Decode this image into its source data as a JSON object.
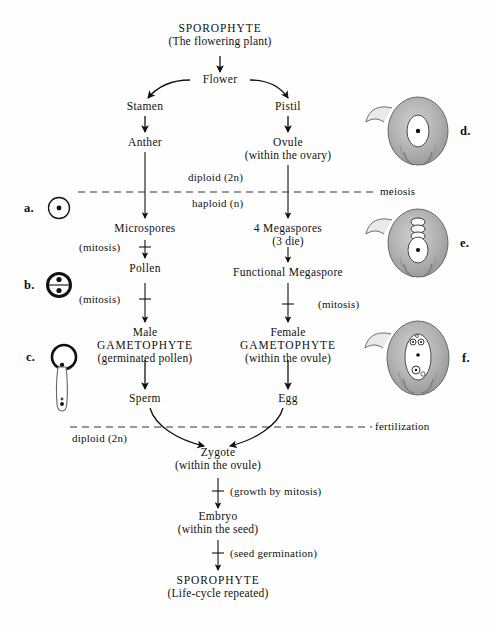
{
  "diagram": {
    "nodes": {
      "sporophyte_top": {
        "line1": "SPOROPHYTE",
        "line2": "(The flowering plant)"
      },
      "flower": {
        "line1": "Flower",
        "line2": ""
      },
      "stamen": {
        "line1": "Stamen",
        "line2": ""
      },
      "pistil": {
        "line1": "Pistil",
        "line2": ""
      },
      "anther": {
        "line1": "Anther",
        "line2": ""
      },
      "ovule": {
        "line1": "Ovule",
        "line2": "(within the ovary)"
      },
      "microspores": {
        "line1": "Microspores",
        "line2": ""
      },
      "megaspores": {
        "line1": "4 Megaspores",
        "line2": "(3 die)"
      },
      "pollen": {
        "line1": "Pollen",
        "line2": ""
      },
      "functional_megaspore": {
        "line1": "Functional Megaspore",
        "line2": ""
      },
      "male_gametophyte": {
        "line1": "Male",
        "line2": "GAMETOPHYTE",
        "line3": "(germinated pollen)"
      },
      "female_gametophyte": {
        "line1": "Female",
        "line2": "GAMETOPHYTE",
        "line3": "(within the ovule)"
      },
      "sperm": {
        "line1": "Sperm",
        "line2": ""
      },
      "egg": {
        "line1": "Egg",
        "line2": ""
      },
      "zygote": {
        "line1": "Zygote",
        "line2": "(within the ovule)"
      },
      "embryo": {
        "line1": "Embryo",
        "line2": "(within the seed)"
      },
      "sporophyte_bottom": {
        "line1": "SPOROPHYTE",
        "line2": "(Life-cycle repeated)"
      }
    },
    "edge_labels": {
      "mitosis_micro_pollen": "(mitosis)",
      "mitosis_pollen_male": "(mitosis)",
      "mitosis_megaspore_female": "(mitosis)",
      "growth_by_mitosis": "(growth by mitosis)",
      "seed_germination": "(seed germination)"
    },
    "ploidy_labels": {
      "diploid_upper": "diploid (2n)",
      "haploid": "haploid (n)",
      "diploid_lower": "diploid (2n)"
    },
    "division_lines": {
      "meiosis": "meiosis",
      "fertilization": "fertilization"
    },
    "figure_labels": {
      "a": "a.",
      "b": "b.",
      "c": "c.",
      "d": "d.",
      "e": "e.",
      "f": "f."
    },
    "figures": {
      "a": "microspore-cell-icon",
      "b": "pollen-grain-two-nuclei-icon",
      "c": "germinated-pollen-tube-icon",
      "d": "ovule-megaspore-mother-cell-icon",
      "e": "ovule-four-megaspores-icon",
      "f": "ovule-female-gametophyte-icon"
    },
    "colors": {
      "ink": "#111111",
      "background": "#fefefe",
      "stipple": "#8d8d8d"
    }
  }
}
